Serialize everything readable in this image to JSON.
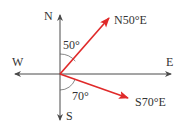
{
  "diagram": {
    "type": "compass-bearings",
    "colors": {
      "axis": "#4a4a4a",
      "vector": "#e02a2a",
      "label": "#333333"
    },
    "directions": {
      "north": "N",
      "south": "S",
      "west": "W",
      "east": "E"
    },
    "vectors": [
      {
        "label": "N50°E",
        "angle_label": "50°",
        "bearing_deg": 50,
        "reference": "N"
      },
      {
        "label": "S70°E",
        "angle_label": "70°",
        "bearing_deg": 70,
        "reference": "S"
      }
    ]
  }
}
